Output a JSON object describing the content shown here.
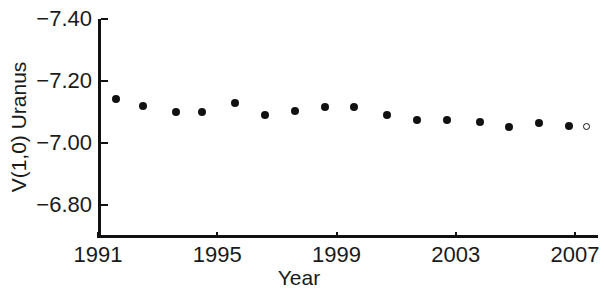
{
  "chart_data": {
    "type": "scatter",
    "title": "",
    "xlabel": "Year",
    "ylabel": "V(1,0) Uranus",
    "xlim": [
      1990.2,
      2008.9
    ],
    "ylim": [
      -7.4,
      -6.8
    ],
    "y_axis_inverted": true,
    "grid": false,
    "legend": null,
    "xticks": [
      "1991",
      "1995",
      "1999",
      "2003",
      "2007"
    ],
    "xtick_values": [
      1991,
      1995,
      1999,
      2003,
      2007
    ],
    "yticks": [
      "-7.40",
      "-7.20",
      "-7.00",
      "-6.80"
    ],
    "ytick_values": [
      -7.4,
      -7.2,
      -7.0,
      -6.8
    ],
    "series": [
      {
        "name": "V(1,0) Uranus",
        "marker": "filled-circle",
        "color": "#111111",
        "points": [
          {
            "x": 1991.6,
            "y": -7.142,
            "marker": "filled-circle"
          },
          {
            "x": 1992.5,
            "y": -7.12,
            "marker": "filled-circle"
          },
          {
            "x": 1993.6,
            "y": -7.101,
            "marker": "filled-circle"
          },
          {
            "x": 1994.5,
            "y": -7.099,
            "marker": "filled-circle"
          },
          {
            "x": 1995.6,
            "y": -7.129,
            "marker": "filled-circle"
          },
          {
            "x": 1996.6,
            "y": -7.091,
            "marker": "filled-circle"
          },
          {
            "x": 1997.6,
            "y": -7.104,
            "marker": "filled-circle"
          },
          {
            "x": 1998.6,
            "y": -7.117,
            "marker": "filled-circle"
          },
          {
            "x": 1999.6,
            "y": -7.117,
            "marker": "filled-circle"
          },
          {
            "x": 2000.7,
            "y": -7.091,
            "marker": "filled-circle"
          },
          {
            "x": 2001.7,
            "y": -7.075,
            "marker": "filled-circle"
          },
          {
            "x": 2002.7,
            "y": -7.075,
            "marker": "filled-circle"
          },
          {
            "x": 2003.8,
            "y": -7.068,
            "marker": "filled-circle"
          },
          {
            "x": 2004.8,
            "y": -7.052,
            "marker": "filled-circle"
          },
          {
            "x": 2005.8,
            "y": -7.065,
            "marker": "filled-circle"
          },
          {
            "x": 2006.8,
            "y": -7.055,
            "marker": "filled-circle"
          },
          {
            "x": 2007.4,
            "y": -7.055,
            "marker": "open-circle"
          }
        ]
      }
    ]
  }
}
